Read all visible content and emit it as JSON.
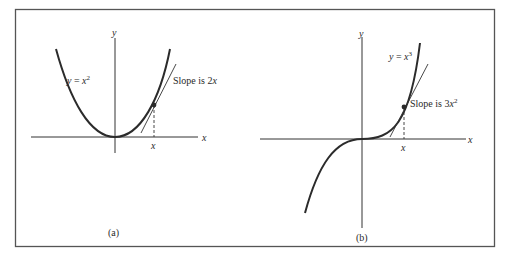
{
  "figure": {
    "frame_color": "#555555",
    "curve_color": "#2b2b2b",
    "axis_color": "#333333",
    "panels": [
      {
        "id": "a",
        "caption": "(a)",
        "function_label": "y = x²",
        "function_label_parts": {
          "lhs": "y",
          "eq": " = ",
          "base": "x",
          "exp": "2"
        },
        "slope_label_parts": {
          "prefix": "Slope is ",
          "coef": "2",
          "var": "x",
          "exp": ""
        },
        "slope_label": "Slope is 2x",
        "axis_x_label": "x",
        "axis_y_label": "y",
        "tick_label": "x"
      },
      {
        "id": "b",
        "caption": "(b)",
        "function_label": "y = x³",
        "function_label_parts": {
          "lhs": "y",
          "eq": " = ",
          "base": "x",
          "exp": "3"
        },
        "slope_label_parts": {
          "prefix": "Slope is ",
          "coef": "3",
          "var": "x",
          "exp": "2"
        },
        "slope_label": "Slope is 3x²",
        "axis_x_label": "x",
        "axis_y_label": "y",
        "tick_label": "x"
      }
    ]
  }
}
